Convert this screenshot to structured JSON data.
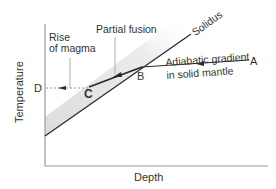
{
  "diagram": {
    "type": "temperature-depth phase diagram",
    "axes": {
      "x_label": "Depth",
      "y_label": "Temperature"
    },
    "curves": {
      "solidus_label": "Solidus",
      "adiabatic_label_line1": "Adiabatic gradient",
      "adiabatic_label_line2": "in solid mantle"
    },
    "annotations": {
      "partial_fusion": "Partial fusion",
      "rise_line1": "Rise",
      "rise_line2": "of magma"
    },
    "points": {
      "A": "A",
      "B": "B",
      "C": "C",
      "D": "D"
    },
    "colors": {
      "line": "#2a2a2a",
      "shade": "#e2e2e2",
      "axis": "#9a9a9a"
    }
  }
}
